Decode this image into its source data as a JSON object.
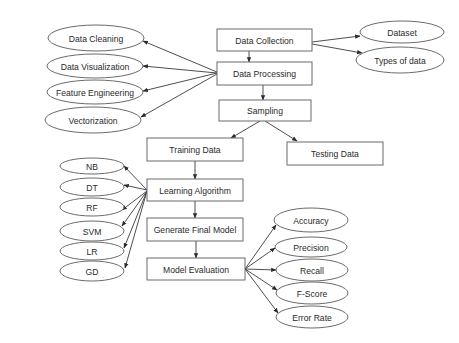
{
  "diagram": {
    "type": "flowchart",
    "title": "",
    "process_nodes": [
      {
        "id": "collection",
        "label": "Data Collection"
      },
      {
        "id": "processing",
        "label": "Data Processing"
      },
      {
        "id": "sampling",
        "label": "Sampling"
      },
      {
        "id": "training",
        "label": "Training Data"
      },
      {
        "id": "testing",
        "label": "Testing Data"
      },
      {
        "id": "learning",
        "label": "Learning Algorithm"
      },
      {
        "id": "final_model",
        "label": "Generate Final Model"
      },
      {
        "id": "evaluation",
        "label": "Model Evaluation"
      }
    ],
    "collection_outputs": [
      {
        "id": "dataset",
        "label": "Dataset"
      },
      {
        "id": "types",
        "label": "Types of data"
      }
    ],
    "processing_steps": [
      {
        "id": "cleaning",
        "label": "Data Cleaning"
      },
      {
        "id": "visualization",
        "label": "Data Visualization"
      },
      {
        "id": "feature_eng",
        "label": "Feature Engineering"
      },
      {
        "id": "vectorization",
        "label": "Vectorization"
      }
    ],
    "algorithms": [
      {
        "id": "nb",
        "label": "NB"
      },
      {
        "id": "dt",
        "label": "DT"
      },
      {
        "id": "rf",
        "label": "RF"
      },
      {
        "id": "svm",
        "label": "SVM"
      },
      {
        "id": "lr",
        "label": "LR"
      },
      {
        "id": "gd",
        "label": "GD"
      }
    ],
    "metrics": [
      {
        "id": "accuracy",
        "label": "Accuracy"
      },
      {
        "id": "precision",
        "label": "Precision"
      },
      {
        "id": "recall",
        "label": "Recall"
      },
      {
        "id": "fscore",
        "label": "F-Score"
      },
      {
        "id": "error_rate",
        "label": "Error Rate"
      }
    ],
    "edges": [
      [
        "collection",
        "processing"
      ],
      [
        "collection",
        "dataset"
      ],
      [
        "collection",
        "types"
      ],
      [
        "processing",
        "cleaning"
      ],
      [
        "processing",
        "visualization"
      ],
      [
        "processing",
        "feature_eng"
      ],
      [
        "processing",
        "vectorization"
      ],
      [
        "processing",
        "sampling"
      ],
      [
        "sampling",
        "training"
      ],
      [
        "sampling",
        "testing"
      ],
      [
        "training",
        "learning"
      ],
      [
        "learning",
        "nb"
      ],
      [
        "learning",
        "dt"
      ],
      [
        "learning",
        "rf"
      ],
      [
        "learning",
        "svm"
      ],
      [
        "learning",
        "lr"
      ],
      [
        "learning",
        "gd"
      ],
      [
        "learning",
        "final_model"
      ],
      [
        "final_model",
        "evaluation"
      ],
      [
        "evaluation",
        "accuracy"
      ],
      [
        "evaluation",
        "precision"
      ],
      [
        "evaluation",
        "recall"
      ],
      [
        "evaluation",
        "fscore"
      ],
      [
        "evaluation",
        "error_rate"
      ]
    ]
  }
}
